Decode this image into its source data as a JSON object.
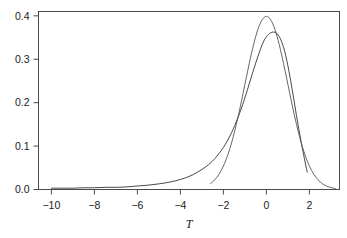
{
  "chart_data": {
    "type": "line",
    "title": "",
    "subtitle": "",
    "xlabel": "T",
    "ylabel": "",
    "xlim": [
      -10.6,
      3.4
    ],
    "ylim": [
      0.0,
      0.41
    ],
    "grid": false,
    "legend": null,
    "xticks": [
      -10,
      -8,
      -6,
      -4,
      -2,
      0,
      2
    ],
    "xticklabels": [
      "-10",
      "-8",
      "-6",
      "-4",
      "-2",
      "0",
      "2"
    ],
    "yticks": [
      0.0,
      0.1,
      0.2,
      0.3,
      0.4
    ],
    "yticklabels": [
      "0.0",
      "0.1",
      "0.2",
      "0.3",
      "0.4"
    ],
    "series": [
      {
        "name": "skewed-density",
        "color": "#333333",
        "x": [
          -10.0,
          -9.5,
          -9.0,
          -8.5,
          -8.0,
          -7.5,
          -7.0,
          -6.5,
          -6.0,
          -5.5,
          -5.0,
          -4.5,
          -4.0,
          -3.6,
          -3.2,
          -2.8,
          -2.4,
          -2.0,
          -1.7,
          -1.4,
          -1.1,
          -0.8,
          -0.5,
          -0.2,
          0.0,
          0.2,
          0.4,
          0.6,
          0.8,
          1.0,
          1.2,
          1.4,
          1.6,
          1.8,
          1.9
        ],
        "y": [
          0.003,
          0.003,
          0.003,
          0.004,
          0.004,
          0.005,
          0.005,
          0.006,
          0.008,
          0.01,
          0.013,
          0.017,
          0.023,
          0.03,
          0.04,
          0.053,
          0.071,
          0.097,
          0.123,
          0.156,
          0.196,
          0.243,
          0.291,
          0.333,
          0.352,
          0.361,
          0.362,
          0.352,
          0.327,
          0.285,
          0.23,
          0.17,
          0.114,
          0.063,
          0.04
        ]
      },
      {
        "name": "normal-density",
        "color": "#555555",
        "x": [
          -2.6,
          -2.4,
          -2.2,
          -2.0,
          -1.8,
          -1.6,
          -1.4,
          -1.2,
          -1.0,
          -0.8,
          -0.6,
          -0.4,
          -0.2,
          0.0,
          0.2,
          0.4,
          0.6,
          0.8,
          1.0,
          1.2,
          1.4,
          1.6,
          1.8,
          2.0,
          2.2,
          2.4,
          2.6,
          2.8,
          3.0,
          3.2
        ],
        "y": [
          0.0136,
          0.0224,
          0.0355,
          0.054,
          0.079,
          0.1109,
          0.1497,
          0.1942,
          0.242,
          0.2897,
          0.3332,
          0.3683,
          0.391,
          0.3989,
          0.391,
          0.3683,
          0.3332,
          0.2897,
          0.242,
          0.1942,
          0.1497,
          0.1109,
          0.079,
          0.054,
          0.0355,
          0.0224,
          0.0136,
          0.0079,
          0.0044,
          0.0024
        ]
      }
    ]
  },
  "axes": {
    "frame_color": "#4a4a4a"
  }
}
